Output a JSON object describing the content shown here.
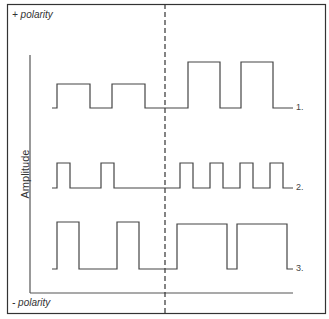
{
  "labels": {
    "positive_polarity": "+ polarity",
    "negative_polarity": "- polarity",
    "y_axis": "Amplitude"
  },
  "rows": [
    {
      "label": "1.",
      "baseline_y": 108,
      "pulse_top_y": 84,
      "left_pulses": [
        [
          57,
          90
        ],
        [
          112,
          145
        ]
      ],
      "right_pulses_top_y": 62,
      "right_pulses": [
        [
          188,
          220
        ],
        [
          241,
          273
        ]
      ]
    },
    {
      "label": "2.",
      "baseline_y": 188,
      "pulse_top_y": 163,
      "left_pulses": [
        [
          57,
          70
        ],
        [
          101,
          114
        ]
      ],
      "right_pulses": [
        [
          180,
          193
        ],
        [
          210,
          223
        ],
        [
          240,
          253
        ],
        [
          270,
          283
        ]
      ]
    },
    {
      "label": "3.",
      "baseline_y": 269,
      "pulse_top_y": 222,
      "left_pulses": [
        [
          57,
          79
        ],
        [
          117,
          139
        ]
      ],
      "right_pulses_top_y": 224,
      "right_pulses": [
        [
          177,
          227
        ],
        [
          237,
          287
        ]
      ]
    }
  ],
  "colors": {
    "line": "#444444",
    "border": "#333333"
  }
}
